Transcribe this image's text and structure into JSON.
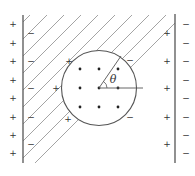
{
  "figure": {
    "angle_label": "θ",
    "colors": {
      "stroke": "#555555",
      "hatch": "#9a9a9a",
      "text": "#333333",
      "background": "#ffffff"
    },
    "walls": {
      "left": {
        "x": 23,
        "y1": 15,
        "y2": 163
      },
      "right": {
        "x": 175,
        "y1": 14,
        "y2": 163
      }
    },
    "hatch": {
      "y_top": 15,
      "y_bottom": 163,
      "spacing": 17,
      "angle_deg": 45
    },
    "cavity": {
      "cx": 99,
      "cy": 88,
      "r": 37.5
    },
    "cavity_dots": [
      {
        "x": 80,
        "y": 69
      },
      {
        "x": 99,
        "y": 69
      },
      {
        "x": 118,
        "y": 69
      },
      {
        "x": 80,
        "y": 88
      },
      {
        "x": 99,
        "y": 88
      },
      {
        "x": 118,
        "y": 88
      },
      {
        "x": 80,
        "y": 107
      },
      {
        "x": 99,
        "y": 107
      },
      {
        "x": 118,
        "y": 107
      }
    ],
    "outer_left_charges": {
      "sign": "+",
      "x": 13,
      "ys": [
        24,
        43,
        61,
        80,
        98,
        117,
        135,
        153
      ]
    },
    "inner_left_charges": {
      "sign": "−",
      "x": 31,
      "ys": [
        33,
        61,
        88,
        117,
        144
      ]
    },
    "outer_right_charges": {
      "sign": "−",
      "x": 186,
      "ys": [
        24,
        43,
        61,
        80,
        98,
        117,
        135,
        153
      ]
    },
    "inner_right_charges": {
      "sign": "+",
      "x": 167,
      "ys": [
        33,
        61,
        88,
        117,
        144
      ]
    },
    "cavity_charges": [
      {
        "sign": "+",
        "x": 69,
        "y": 61
      },
      {
        "sign": "+",
        "x": 56,
        "y": 88
      },
      {
        "sign": "+",
        "x": 68,
        "y": 119
      },
      {
        "sign": "−",
        "x": 130,
        "y": 60
      },
      {
        "sign": "−",
        "x": 130,
        "y": 117
      }
    ]
  }
}
